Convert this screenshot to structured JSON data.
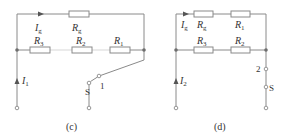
{
  "figure": {
    "circuits": [
      {
        "id": "c",
        "caption": "(c)",
        "labels": {
          "current_top": {
            "main": "I",
            "sub": "g"
          },
          "current_input": {
            "main": "I",
            "sub": "1"
          },
          "switch": "S",
          "switch_position": "1"
        },
        "resistors": [
          {
            "name": "R",
            "sub": "g",
            "branch": "top"
          },
          {
            "name": "R",
            "sub": "3",
            "branch": "middle"
          },
          {
            "name": "R",
            "sub": "2",
            "branch": "middle"
          },
          {
            "name": "R",
            "sub": "1",
            "branch": "middle"
          }
        ]
      },
      {
        "id": "d",
        "caption": "(d)",
        "labels": {
          "current_top": {
            "main": "I",
            "sub": "g"
          },
          "current_input": {
            "main": "I",
            "sub": "2"
          },
          "switch": "S",
          "switch_position": "2"
        },
        "resistors": [
          {
            "name": "R",
            "sub": "g",
            "branch": "top"
          },
          {
            "name": "R",
            "sub": "1",
            "branch": "top"
          },
          {
            "name": "R",
            "sub": "3",
            "branch": "middle"
          },
          {
            "name": "R",
            "sub": "2",
            "branch": "middle"
          }
        ]
      }
    ],
    "colors": {
      "wire": "#8a8a8a",
      "node": "#6e6e6e",
      "text": "#333333"
    }
  }
}
